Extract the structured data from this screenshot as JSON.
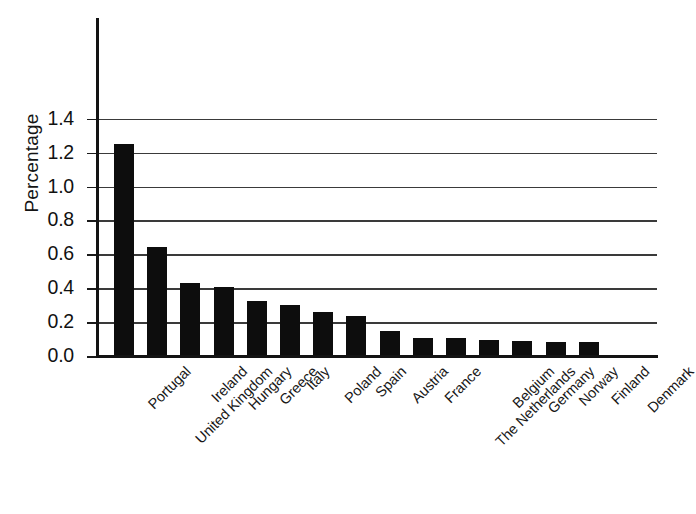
{
  "chart_data": {
    "type": "bar",
    "title": "",
    "subtitle": "",
    "xlabel": "",
    "ylabel": "Percentage",
    "ylim": [
      0.0,
      1.5
    ],
    "ytick_values": [
      0.0,
      0.2,
      0.4,
      0.6,
      0.8,
      1.0,
      1.2,
      1.4
    ],
    "ytick_labels": [
      "0.0",
      "0.2",
      "0.4",
      "0.6",
      "0.8",
      "1.0",
      "1.2",
      "1.4"
    ],
    "grid": "horizontal",
    "legend": "none",
    "bar_color": "#0d0d0d",
    "categories": [
      "Portugal",
      "United Kingdom",
      "Ireland",
      "Hungary",
      "Greece",
      "Italy",
      "Poland",
      "Spain",
      "Austria",
      "France",
      "The Netherlands",
      "Belgium",
      "Germany",
      "Norway",
      "Finland",
      "Denmark"
    ],
    "values": [
      1.25,
      0.645,
      0.43,
      0.41,
      0.325,
      0.3,
      0.26,
      0.235,
      0.15,
      0.105,
      0.105,
      0.095,
      0.09,
      0.085,
      0.08,
      0.0
    ],
    "annotations": []
  },
  "axis": {
    "y_title": "Percentage"
  }
}
